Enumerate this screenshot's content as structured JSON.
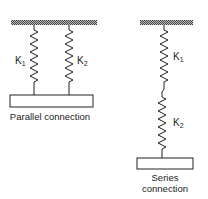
{
  "diagram": {
    "parallel": {
      "spring_labels": [
        "K",
        "K"
      ],
      "spring_subscripts": [
        "1",
        "2"
      ],
      "caption": "Parallel connection"
    },
    "series": {
      "spring_labels": [
        "K",
        "K"
      ],
      "spring_subscripts": [
        "1",
        "2"
      ],
      "caption_line1": "Series",
      "caption_line2": "connection"
    },
    "colors": {
      "ink": "#222222",
      "hatch": "#555555",
      "background": "#ffffff"
    }
  }
}
